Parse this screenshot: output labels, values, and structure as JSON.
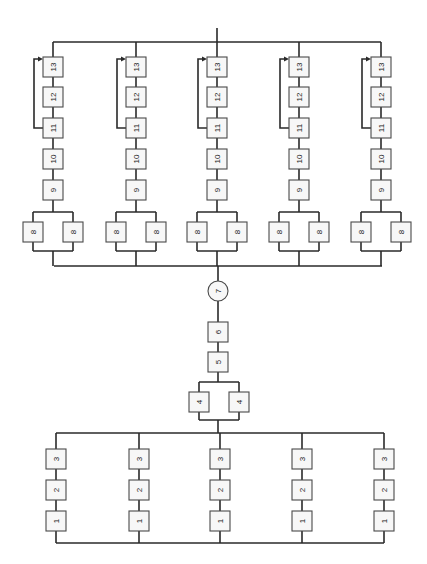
{
  "diagram": {
    "title": "",
    "orientation": "rotated-90",
    "colors": {
      "line": "#2a2a2a",
      "box_stroke": "#4a4a4a",
      "box_fill": "#f7f7f7",
      "background": "#ffffff"
    },
    "upper_section": {
      "description": "Five parallel branches, each: parallel pair of 8 -> 9 -> 10 -> 11 -> 12 -> 13 with a bypass arrow from 11 to 13",
      "top_bus": {
        "y": 42,
        "x_start": 53,
        "x_end": 381,
        "output_stub": {
          "x": 217,
          "y_top": 28
        }
      },
      "mid_bus": {
        "y": 266,
        "x_start": 54,
        "x_end": 382
      },
      "branches": [
        {
          "x": 53,
          "labels": {
            "b13": "13",
            "b12": "12",
            "b11": "11",
            "b10": "10",
            "b9": "9",
            "b8a": "8",
            "b8b": "8"
          }
        },
        {
          "x": 136,
          "labels": {
            "b13": "13",
            "b12": "12",
            "b11": "11",
            "b10": "10",
            "b9": "9",
            "b8a": "8",
            "b8b": "8"
          }
        },
        {
          "x": 217,
          "labels": {
            "b13": "13",
            "b12": "12",
            "b11": "11",
            "b10": "10",
            "b9": "9",
            "b8a": "8",
            "b8b": "8"
          }
        },
        {
          "x": 299,
          "labels": {
            "b13": "13",
            "b12": "12",
            "b11": "11",
            "b10": "10",
            "b9": "9",
            "b8a": "8",
            "b8b": "8"
          }
        },
        {
          "x": 381,
          "labels": {
            "b13": "13",
            "b12": "12",
            "b11": "11",
            "b10": "10",
            "b9": "9",
            "b8a": "8",
            "b8b": "8"
          }
        }
      ],
      "rows_y": {
        "b13": 67,
        "b12": 97,
        "b11": 128,
        "b10": 159,
        "b9": 190,
        "b8": 232
      }
    },
    "center_chain": {
      "x": 218,
      "node7": {
        "label": "7",
        "shape": "circle",
        "y": 291
      },
      "node6": {
        "label": "6",
        "y": 332
      },
      "node5": {
        "label": "5",
        "y": 362
      },
      "node4_pair": {
        "labels": [
          "4",
          "4"
        ],
        "y": 402,
        "x_left": 199,
        "x_right": 239
      }
    },
    "lower_section": {
      "description": "Five parallel branches, each: 1 -> 2 -> 3 in series",
      "top_bus": {
        "y": 433,
        "x_start": 56,
        "x_end": 384
      },
      "bottom_bus": {
        "y": 543,
        "x_start": 56,
        "x_end": 384
      },
      "branches": [
        {
          "x": 56,
          "labels": {
            "b3": "3",
            "b2": "2",
            "b1": "1"
          }
        },
        {
          "x": 139,
          "labels": {
            "b3": "3",
            "b2": "2",
            "b1": "1"
          }
        },
        {
          "x": 220,
          "labels": {
            "b3": "3",
            "b2": "2",
            "b1": "1"
          }
        },
        {
          "x": 302,
          "labels": {
            "b3": "3",
            "b2": "2",
            "b1": "1"
          }
        },
        {
          "x": 384,
          "labels": {
            "b3": "3",
            "b2": "2",
            "b1": "1"
          }
        }
      ],
      "rows_y": {
        "b3": 459,
        "b2": 490,
        "b1": 521
      }
    }
  }
}
